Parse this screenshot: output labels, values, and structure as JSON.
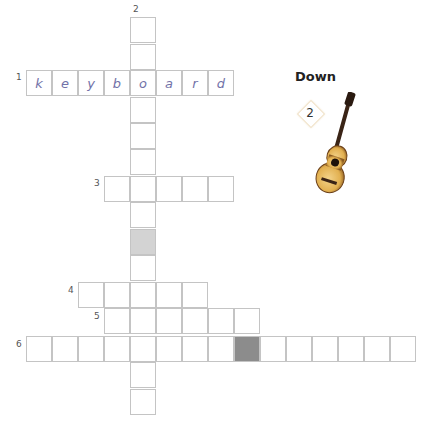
{
  "puzzle": {
    "type": "crossword",
    "cell_size": 26,
    "clue_numbers": [
      {
        "n": "1",
        "x": 16,
        "y": 72
      },
      {
        "n": "2",
        "x": 133,
        "y": 4
      },
      {
        "n": "3",
        "x": 94,
        "y": 178
      },
      {
        "n": "4",
        "x": 68,
        "y": 285
      },
      {
        "n": "5",
        "x": 94,
        "y": 311
      },
      {
        "n": "6",
        "x": 16,
        "y": 339
      }
    ],
    "across_1": {
      "letters": [
        "k",
        "e",
        "y",
        "b",
        "o",
        "a",
        "r",
        "d"
      ]
    }
  },
  "clue_panel": {
    "heading": "Down",
    "badge_number": "2",
    "image": "guitar-icon"
  }
}
